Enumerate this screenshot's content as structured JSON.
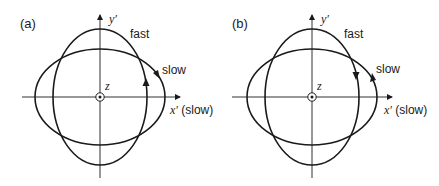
{
  "panels": [
    {
      "tag": "(a)",
      "axis_y_label": "y′",
      "axis_x_label": "x′ (slow)",
      "axis_z_label": "z",
      "fast_label": "fast",
      "slow_label": "slow",
      "fast_direction": "counterclockwise",
      "slow_direction": "clockwise"
    },
    {
      "tag": "(b)",
      "axis_y_label": "y′",
      "axis_x_label": "x′ (slow)",
      "axis_z_label": "z",
      "fast_label": "fast",
      "slow_label": "slow",
      "fast_direction": "clockwise",
      "slow_direction": "counterclockwise"
    }
  ],
  "colors": {
    "stroke": "#1a1a1a",
    "background": "#ffffff"
  }
}
